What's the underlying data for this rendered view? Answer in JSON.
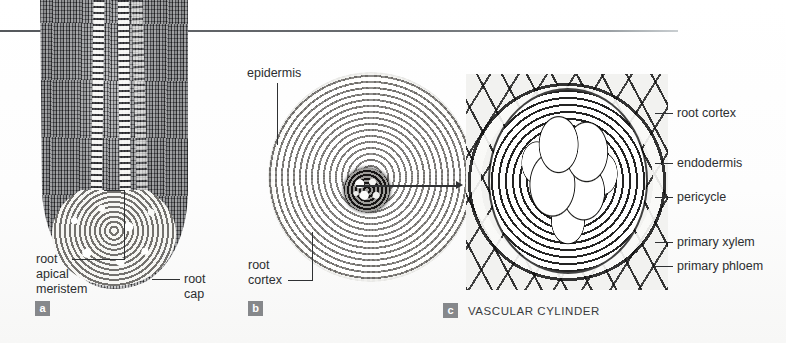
{
  "figure": {
    "background_color": "#fdfdfd",
    "rule_color": "#55585c",
    "badge_color": "#86888b",
    "label_color": "#2c2e30",
    "leader_color": "#2f3133"
  },
  "panels": [
    {
      "id": "a",
      "badge": "a",
      "caption": "",
      "subject": "longitudinal-section-root-tip"
    },
    {
      "id": "b",
      "badge": "b",
      "caption": "",
      "subject": "transverse-section-whole-root"
    },
    {
      "id": "c",
      "badge": "c",
      "caption": "VASCULAR CYLINDER",
      "subject": "transverse-section-vascular-cylinder"
    }
  ],
  "labels": {
    "panel_a": {
      "root_apical_meristem": "root\napical\nmeristem",
      "root_apical_meristem_line1": "root",
      "root_apical_meristem_line2": "apical",
      "root_apical_meristem_line3": "meristem",
      "root_cap_line1": "root",
      "root_cap_line2": "cap"
    },
    "panel_b": {
      "epidermis": "epidermis",
      "root_cortex_line1": "root",
      "root_cortex_line2": "cortex"
    },
    "panel_c": {
      "root_cortex": "root cortex",
      "endodermis": "endodermis",
      "pericycle": "pericycle",
      "primary_xylem": "primary xylem",
      "primary_phloem": "primary phloem"
    }
  }
}
